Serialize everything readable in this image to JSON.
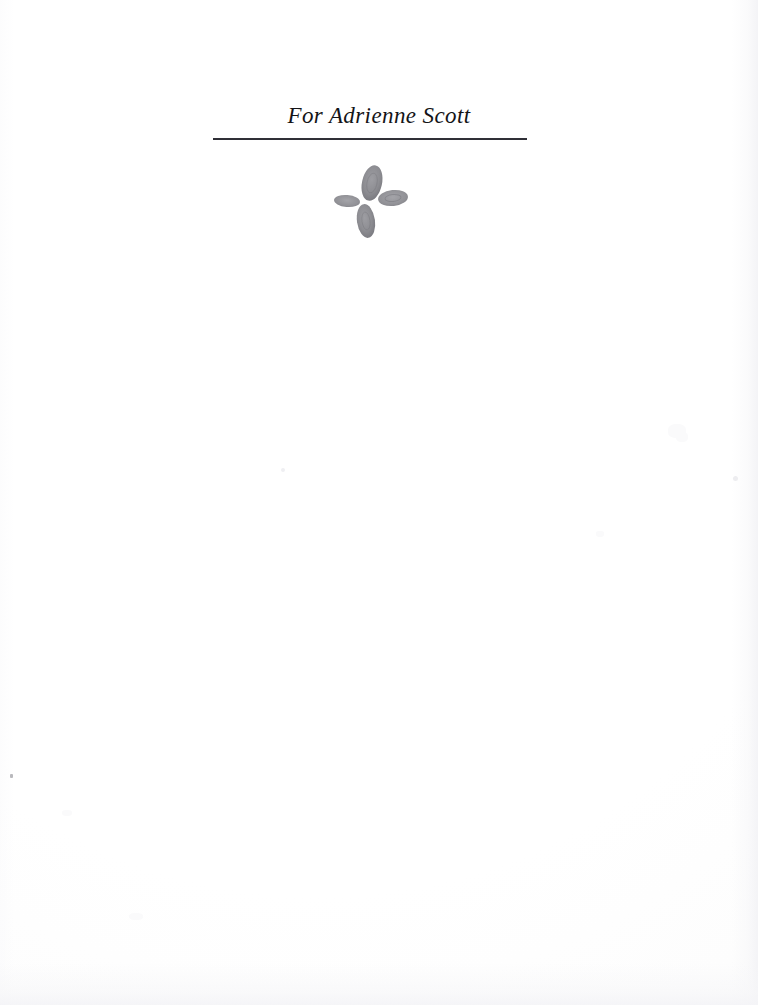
{
  "page": {
    "kind": "book-dedication-page",
    "width": 758,
    "height": 1005,
    "background_color": "#fefefe",
    "paper_tone_color": "#fbfbfc"
  },
  "dedication": {
    "text": "For Adrienne Scott",
    "text_color": "#141417",
    "rule": {
      "color": "#1c1c22",
      "left": 213,
      "top": 138,
      "width": 314,
      "height": 2
    }
  },
  "ornament": {
    "name": "four-petal-floral-ornament",
    "color": "#8d8d92",
    "color_light": "#a7a7ac",
    "color_dark": "#6f6f75",
    "petals": [
      {
        "position": "top",
        "center_x": 372,
        "center_y": 183,
        "rx": 10,
        "ry": 18,
        "rotation": 12
      },
      {
        "position": "right",
        "center_x": 393,
        "center_y": 198,
        "rx": 15,
        "ry": 8,
        "rotation": -6
      },
      {
        "position": "bottom",
        "center_x": 366,
        "center_y": 221,
        "rx": 9,
        "ry": 17,
        "rotation": -8
      },
      {
        "position": "left",
        "center_x": 347,
        "center_y": 201,
        "rx": 13,
        "ry": 6,
        "rotation": 5
      }
    ]
  },
  "scan_artifacts": {
    "dust_specks": [
      {
        "x": 10,
        "y": 774
      }
    ],
    "faint_marks": [
      {
        "x": 668,
        "y": 424,
        "w": 18,
        "h": 14
      },
      {
        "x": 676,
        "y": 432,
        "w": 12,
        "h": 10
      },
      {
        "x": 733,
        "y": 476,
        "w": 5,
        "h": 5
      },
      {
        "x": 281,
        "y": 468,
        "w": 4,
        "h": 4
      },
      {
        "x": 596,
        "y": 531,
        "w": 8,
        "h": 6
      },
      {
        "x": 129,
        "y": 913,
        "w": 14,
        "h": 7
      },
      {
        "x": 62,
        "y": 810,
        "w": 10,
        "h": 6
      }
    ]
  }
}
